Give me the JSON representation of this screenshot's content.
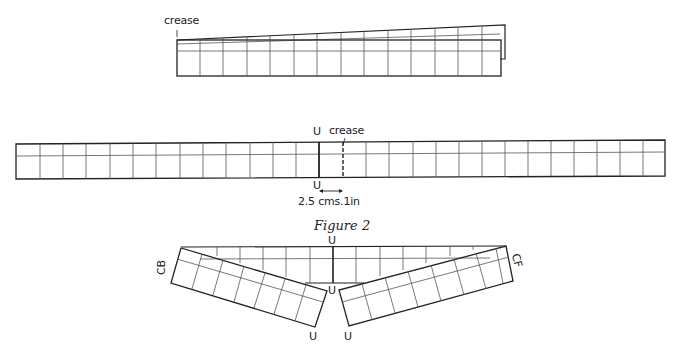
{
  "figure_top": {
    "crease_label": "crease",
    "columns": 14
  },
  "figure_middle": {
    "crease_label": "crease",
    "u_top": "U",
    "u_bottom": "U",
    "measure_label": "2.5 cms.1in",
    "columns": 28
  },
  "caption": "Figure 2",
  "figure_bottom": {
    "u_top": "U",
    "u_center": "U",
    "u_left": "U",
    "u_right": "U",
    "cb_label": "CB",
    "cf_label": "CF"
  },
  "colors": {
    "line": "#222222",
    "grid": "#555555",
    "background": "#ffffff"
  }
}
